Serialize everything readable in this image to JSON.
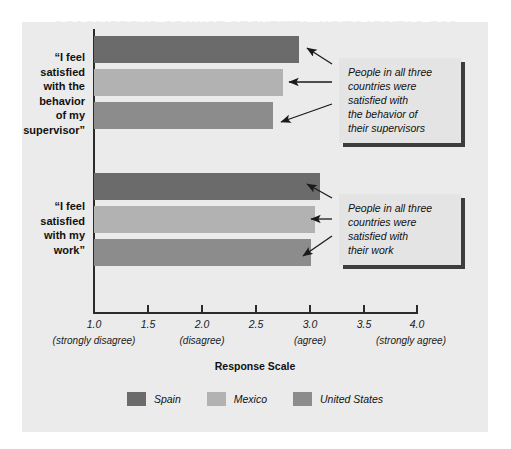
{
  "bleed_through_text": "JOB SATISFACTION: ATTITUDES TOWARD SUPERVISORS",
  "chart_data": {
    "type": "bar",
    "orientation": "horizontal",
    "title": "",
    "xlabel": "Response Scale",
    "ylabel": "",
    "xlim": [
      1.0,
      4.0
    ],
    "grid": false,
    "legend_position": "bottom",
    "categories": [
      "“I feel satisfied with the behavior of my supervisor”",
      "“I feel satisfied with my work”"
    ],
    "series": [
      {
        "name": "Spain",
        "color": "#6b6b6b",
        "values": [
          2.9,
          3.1
        ]
      },
      {
        "name": "Mexico",
        "color": "#b2b2b2",
        "values": [
          2.75,
          3.05
        ]
      },
      {
        "name": "United States",
        "color": "#8c8c8c",
        "values": [
          2.66,
          3.01
        ]
      }
    ],
    "xticks": [
      {
        "value": 1.0,
        "label": "1.0",
        "sublabel": "(strongly disagree)"
      },
      {
        "value": 1.5,
        "label": "1.5",
        "sublabel": ""
      },
      {
        "value": 2.0,
        "label": "2.0",
        "sublabel": "(disagree)"
      },
      {
        "value": 2.5,
        "label": "2.5",
        "sublabel": ""
      },
      {
        "value": 3.0,
        "label": "3.0",
        "sublabel": "(agree)"
      },
      {
        "value": 3.5,
        "label": "3.5",
        "sublabel": ""
      },
      {
        "value": 4.0,
        "label": "4.0",
        "sublabel": "(strongly agree)"
      }
    ],
    "annotations": [
      "People in all three countries were satisfied with the behavior of their supervisors",
      "People in all three countries were satisfied with their work"
    ]
  },
  "category_labels": {
    "supervisor": [
      "“I feel",
      "satisfied",
      "with the",
      "behavior",
      "of my",
      "supervisor”"
    ],
    "work": [
      "“I feel",
      "satisfied",
      "with my",
      "work”"
    ]
  },
  "annotation_supervisor": {
    "line1": "People in all three",
    "line2": "countries were",
    "line3": "satisfied with",
    "line4": "the behavior of",
    "line5": "their supervisors"
  },
  "annotation_work": {
    "line1": "People in all three",
    "line2": "countries were",
    "line3": "satisfied with",
    "line4": "their work"
  },
  "axis": {
    "title": "Response Scale",
    "tick_1_0": "1.0",
    "tick_1_5": "1.5",
    "tick_2_0": "2.0",
    "tick_2_5": "2.5",
    "tick_3_0": "3.0",
    "tick_3_5": "3.5",
    "tick_4_0": "4.0",
    "sub_1_0": "(strongly disagree)",
    "sub_2_0": "(disagree)",
    "sub_3_0": "(agree)",
    "sub_4_0": "(strongly agree)"
  },
  "legend": {
    "items": [
      {
        "label": "Spain",
        "color": "#6b6b6b"
      },
      {
        "label": "Mexico",
        "color": "#b2b2b2"
      },
      {
        "label": "United States",
        "color": "#8c8c8c"
      }
    ]
  }
}
